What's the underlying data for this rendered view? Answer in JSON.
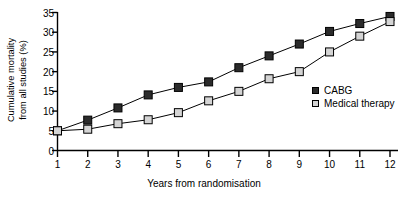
{
  "chart_data": {
    "type": "line",
    "title": "",
    "xlabel": "Years from randomisation",
    "ylabel": "Cumulative mortality from all studies (%)",
    "ylabel_line1": "Cumulative mortality",
    "ylabel_line2": "from all studies (%)",
    "x": [
      1,
      2,
      3,
      4,
      5,
      6,
      7,
      8,
      9,
      10,
      11,
      12
    ],
    "xtick_labels": [
      "1",
      "2",
      "3",
      "4",
      "5",
      "6",
      "7",
      "8",
      "9",
      "10",
      "11",
      "12"
    ],
    "ytick_labels": [
      "0",
      "5",
      "10",
      "15",
      "20",
      "25",
      "30",
      "35"
    ],
    "yticks": [
      0,
      5,
      10,
      15,
      20,
      25,
      30,
      35
    ],
    "xlim": [
      1,
      12
    ],
    "ylim": [
      0,
      35
    ],
    "grid": false,
    "legend_position": "right-inside",
    "series": [
      {
        "name": "CABG",
        "marker": "filled-square",
        "color": "#2b2b2b",
        "values": [
          5,
          7.7,
          10.8,
          14.1,
          16,
          17.4,
          21,
          24,
          27,
          30.2,
          32.2,
          34
        ]
      },
      {
        "name": "Medical therapy",
        "marker": "open-square",
        "color": "#d4d4d4",
        "values": [
          5,
          5.4,
          6.8,
          7.8,
          9.6,
          12.6,
          15,
          18.2,
          20,
          25,
          29,
          32.7
        ]
      }
    ]
  },
  "legend": {
    "items": [
      {
        "label": "CABG",
        "marker": "filled"
      },
      {
        "label": "Medical therapy",
        "marker": "open"
      }
    ]
  }
}
